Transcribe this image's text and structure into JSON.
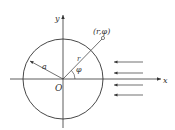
{
  "diagram": {
    "labels": {
      "y_axis": "y",
      "x_axis": "x",
      "origin": "O",
      "radius": "a",
      "r": "r",
      "angle": "φ",
      "point": "(r,φ)"
    },
    "colors": {
      "stroke": "#333333",
      "background": "#ffffff"
    },
    "flow_arrow_count": 4
  }
}
